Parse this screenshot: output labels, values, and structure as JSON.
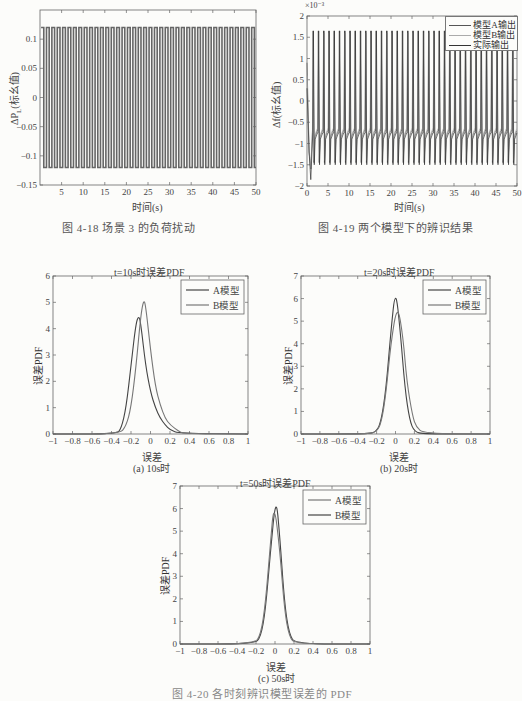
{
  "figures": {
    "fig_4_18": {
      "caption": "图 4-18   场景 3 的负荷扰动",
      "ylabel": "ΔP",
      "ylabel_sub": "L",
      "ylabel_suffix": "(标幺值)",
      "xlabel": "时间(s)"
    },
    "fig_4_19": {
      "caption": "图 4-19   两个模型下的辨识结果",
      "ylabel": "Δf(标幺值)",
      "xlabel": "时间(s)",
      "exponent": "×10⁻³",
      "legend": [
        "模型A输出",
        "模型B输出",
        "实际输出"
      ]
    },
    "fig_4_20": {
      "caption": "图 4-20   各时刻辨识模型误差的 PDF",
      "panels": [
        {
          "title": "t=10s时误差PDF",
          "sublabel": "(a) 10s时",
          "xlabel": "误差",
          "ylabel": "误差PDF",
          "legend": [
            "A模型",
            "B模型"
          ]
        },
        {
          "title": "t=20s时误差PDF",
          "sublabel": "(b) 20s时",
          "xlabel": "误差",
          "ylabel": "误差PDF",
          "legend": [
            "A模型",
            "B模型"
          ]
        },
        {
          "title": "t=50s时误差PDF",
          "sublabel": "(c) 50s时",
          "xlabel": "误差",
          "ylabel": "误差PDF",
          "legend": [
            "A模型",
            "B模型"
          ]
        }
      ]
    }
  },
  "chart_data": [
    {
      "id": "fig_4_18",
      "type": "line",
      "title": "",
      "xlabel": "时间(s)",
      "ylabel": "ΔP_L(标幺值)",
      "xlim": [
        0,
        50
      ],
      "ylim": [
        -0.15,
        0.15
      ],
      "xticks": [
        5,
        10,
        15,
        20,
        25,
        30,
        35,
        40,
        45,
        50
      ],
      "yticks": [
        -0.15,
        -0.1,
        -0.05,
        0,
        0.05,
        0.1
      ],
      "series": [
        {
          "name": "load disturbance",
          "description": "square wave alternating ±0.12, period ≈1.25s",
          "amplitude": 0.12,
          "period_s": 1.25
        }
      ],
      "grid": false
    },
    {
      "id": "fig_4_19",
      "type": "line",
      "title": "",
      "xlabel": "时间(s)",
      "ylabel": "Δf(标幺值)",
      "y_multiplier": "×10^-3",
      "xlim": [
        0,
        50
      ],
      "ylim": [
        -2,
        2
      ],
      "xticks": [
        0,
        5,
        10,
        15,
        20,
        25,
        30,
        35,
        40,
        45,
        50
      ],
      "yticks": [
        -2,
        -1.5,
        -1,
        -0.5,
        0,
        0.5,
        1,
        1.5,
        2
      ],
      "legend_position": "upper right",
      "series": [
        {
          "name": "模型A输出",
          "description": "periodic spikes peak ≈1.65, trough ≈-1.45, baseline ≈-0.7"
        },
        {
          "name": "模型B输出",
          "description": "periodic spikes peak ≈1.6, trough ≈-1.4, baseline ≈-0.65"
        },
        {
          "name": "实际输出",
          "description": "periodic spikes peak ≈1.65, trough ≈-1.5, baseline ≈-0.75; initial dip ≈-1.85"
        }
      ],
      "grid": false
    },
    {
      "id": "fig_4_20a",
      "type": "line",
      "title": "t=10s时误差PDF",
      "xlabel": "误差",
      "ylabel": "误差PDF",
      "xlim": [
        -1,
        1
      ],
      "ylim": [
        0,
        6
      ],
      "xticks": [
        -1,
        -0.8,
        -0.6,
        -0.4,
        -0.2,
        0,
        0.2,
        0.4,
        0.6,
        0.8,
        1
      ],
      "yticks": [
        0,
        1,
        2,
        3,
        4,
        5,
        6
      ],
      "legend_position": "upper right",
      "series": [
        {
          "name": "A模型",
          "x": [
            -1,
            -0.35,
            -0.3,
            -0.25,
            -0.2,
            -0.15,
            -0.12,
            -0.1,
            -0.05,
            0,
            0.05,
            0.1,
            0.15,
            0.2,
            0.3,
            1
          ],
          "y": [
            0,
            0,
            0.2,
            1.0,
            2.6,
            4.2,
            4.5,
            4.2,
            2.6,
            1.6,
            1.0,
            0.6,
            0.35,
            0.15,
            0.02,
            0
          ]
        },
        {
          "name": "B模型",
          "x": [
            -1,
            -0.32,
            -0.25,
            -0.2,
            -0.15,
            -0.1,
            -0.07,
            -0.05,
            0,
            0.05,
            0.1,
            0.15,
            0.2,
            0.3,
            0.35,
            1
          ],
          "y": [
            0,
            0,
            0.3,
            1.0,
            2.5,
            4.5,
            5.1,
            4.9,
            3.2,
            1.8,
            1.1,
            0.6,
            0.35,
            0.08,
            0.02,
            0
          ]
        }
      ],
      "grid": false
    },
    {
      "id": "fig_4_20b",
      "type": "line",
      "title": "t=20s时误差PDF",
      "xlabel": "误差",
      "ylabel": "误差PDF",
      "xlim": [
        -1,
        1
      ],
      "ylim": [
        0,
        7
      ],
      "xticks": [
        -1,
        -0.8,
        -0.6,
        -0.4,
        -0.2,
        0,
        0.2,
        0.4,
        0.6,
        0.8,
        1
      ],
      "yticks": [
        0,
        1,
        2,
        3,
        4,
        5,
        6,
        7
      ],
      "legend_position": "upper right",
      "series": [
        {
          "name": "A模型",
          "x": [
            -1,
            -0.3,
            -0.2,
            -0.15,
            -0.1,
            -0.05,
            0,
            0.05,
            0.1,
            0.15,
            0.2,
            0.3,
            1
          ],
          "y": [
            0,
            0,
            0.1,
            0.6,
            2.0,
            4.5,
            6.5,
            4.6,
            2.0,
            0.6,
            0.1,
            0,
            0
          ]
        },
        {
          "name": "B模型",
          "x": [
            -1,
            -0.3,
            -0.2,
            -0.15,
            -0.1,
            -0.05,
            0.02,
            0.08,
            0.12,
            0.18,
            0.22,
            0.3,
            1
          ],
          "y": [
            0,
            0,
            0.1,
            0.5,
            1.8,
            4.0,
            5.8,
            4.3,
            2.3,
            0.8,
            0.3,
            0.02,
            0
          ]
        }
      ],
      "grid": false
    },
    {
      "id": "fig_4_20c",
      "type": "line",
      "title": "t=50s时误差PDF",
      "xlabel": "误差",
      "ylabel": "误差PDF",
      "xlim": [
        -1,
        1
      ],
      "ylim": [
        0,
        7
      ],
      "xticks": [
        -1,
        -0.8,
        -0.6,
        -0.4,
        -0.2,
        0,
        0.2,
        0.4,
        0.6,
        0.8,
        1
      ],
      "yticks": [
        0,
        1,
        2,
        3,
        4,
        5,
        6,
        7
      ],
      "legend_position": "upper right",
      "series": [
        {
          "name": "A模型",
          "x": [
            -1,
            -0.22,
            -0.15,
            -0.1,
            -0.05,
            0.01,
            0.05,
            0.1,
            0.15,
            0.22,
            1
          ],
          "y": [
            0,
            0,
            0.3,
            1.5,
            4.0,
            6.6,
            4.8,
            1.8,
            0.4,
            0,
            0
          ]
        },
        {
          "name": "B模型",
          "x": [
            -1,
            -0.22,
            -0.15,
            -0.1,
            -0.05,
            -0.01,
            0.05,
            0.1,
            0.15,
            0.22,
            1
          ],
          "y": [
            0,
            0,
            0.4,
            1.8,
            4.4,
            6.3,
            4.2,
            1.5,
            0.3,
            0,
            0
          ]
        }
      ],
      "grid": false
    }
  ]
}
